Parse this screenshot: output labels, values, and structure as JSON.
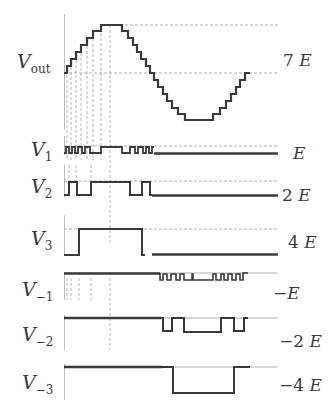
{
  "figure": {
    "labels_left": [
      {
        "id": "vout",
        "main": "V",
        "sub": "out"
      },
      {
        "id": "v1",
        "main": "V",
        "sub": "1"
      },
      {
        "id": "v2",
        "main": "V",
        "sub": "2"
      },
      {
        "id": "v3",
        "main": "V",
        "sub": "3"
      },
      {
        "id": "vm1",
        "main": "V",
        "sub": "−1"
      },
      {
        "id": "vm2",
        "main": "V",
        "sub": "−2"
      },
      {
        "id": "vm3",
        "main": "V",
        "sub": "−3"
      }
    ],
    "labels_right": [
      {
        "id": "vout",
        "coef": "7",
        "unit": "E"
      },
      {
        "id": "v1",
        "coef": "",
        "unit": "E"
      },
      {
        "id": "v2",
        "coef": "2",
        "unit": "E"
      },
      {
        "id": "v3",
        "coef": "4",
        "unit": "E"
      },
      {
        "id": "vm1",
        "coef": "−",
        "unit": "E"
      },
      {
        "id": "vm2",
        "coef": "−2",
        "unit": "E"
      },
      {
        "id": "vm3",
        "coef": "−4",
        "unit": "E"
      }
    ]
  },
  "colors": {
    "stroke": "#3a3a3a",
    "dash": "#8a8a8a",
    "background": "#ffffff"
  }
}
